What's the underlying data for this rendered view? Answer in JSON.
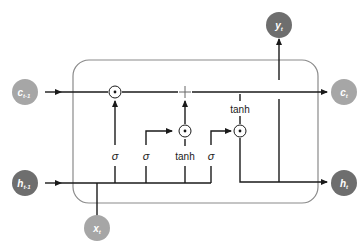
{
  "diagram": {
    "type": "LSTM cell",
    "colors": {
      "line": "#1a1a1a",
      "box": "#8a8a8a",
      "node_light": "#a6a6a6",
      "node_dark": "#6e6e6e",
      "node_text": "#ffffff"
    },
    "nodes": {
      "c_prev": {
        "base": "c",
        "sub": "t-1"
      },
      "h_prev": {
        "base": "h",
        "sub": "t-1"
      },
      "x_t": {
        "base": "x",
        "sub": "t"
      },
      "y_t": {
        "base": "y",
        "sub": "t"
      },
      "c_t": {
        "base": "c",
        "sub": "t"
      },
      "h_t": {
        "base": "h",
        "sub": "t"
      }
    },
    "ops": {
      "mult": "⊙",
      "add": "+"
    },
    "gates": {
      "forget": "σ",
      "input": "σ",
      "candidate": "tanh",
      "output": "σ",
      "cell_tanh": "tanh"
    }
  }
}
